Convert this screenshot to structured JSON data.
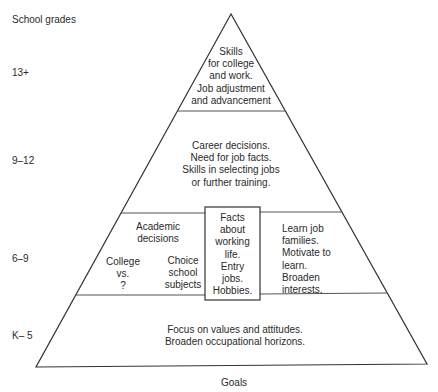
{
  "axis_title": "School grades",
  "footer_label": "Goals",
  "colors": {
    "line": "#333333",
    "text": "#2a2a2a",
    "background": "#ffffff"
  },
  "levels": [
    {
      "grade": "13+",
      "text": "Skills\nfor college\nand work.\nJob adjustment\nand advancement"
    },
    {
      "grade": "9–12",
      "text": "Career decisions.\nNeed for job facts.\nSkills in selecting jobs\nor further training."
    },
    {
      "grade": "6–9",
      "academic": "Academic\ndecisions",
      "college": "College\nvs.\n?",
      "choice": "Choice\nschool\nsubjects",
      "facts": "Facts\nabout\nworking\nlife.\nEntry\njobs.\nHobbies.",
      "learn": "Learn job\nfamilies.\nMotivate to\nlearn.\nBroaden\ninterests."
    },
    {
      "grade": "K– 5",
      "text": "Focus on values and attitudes.\nBroaden occupational horizons."
    }
  ]
}
